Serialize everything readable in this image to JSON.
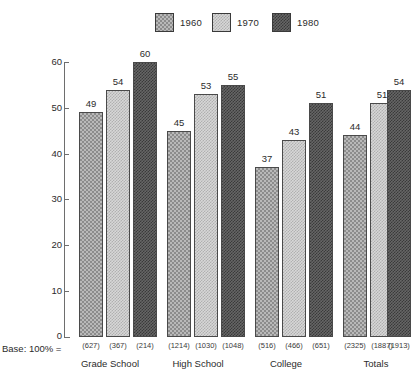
{
  "chart_data": {
    "type": "bar",
    "title": "",
    "xlabel": "",
    "ylabel": "",
    "ylim": [
      0,
      60
    ],
    "yticks": [
      0,
      10,
      20,
      30,
      40,
      50,
      60
    ],
    "grid": false,
    "legend_position": "top-center",
    "categories": [
      "Grade School",
      "High School",
      "College",
      "Totals"
    ],
    "series": [
      {
        "name": "1960",
        "values": [
          49,
          45,
          37,
          44
        ],
        "bases": [
          "(627)",
          "(1214)",
          "(516)",
          "(2325)"
        ],
        "pattern": "cross-hatch-medium",
        "color": "#b9b9b9"
      },
      {
        "name": "1970",
        "values": [
          54,
          53,
          43,
          51
        ],
        "bases": [
          "(367)",
          "(1030)",
          "(466)",
          "(1887)"
        ],
        "pattern": "fine-dot-light",
        "color": "#d7d7d7"
      },
      {
        "name": "1980",
        "values": [
          60,
          55,
          51,
          54
        ],
        "bases": [
          "(214)",
          "(1048)",
          "(651)",
          "(1913)"
        ],
        "pattern": "dense-dark",
        "color": "#666666"
      }
    ],
    "base_label": "Base: 100% =",
    "axis_color": "#6e6e6e",
    "text_color": "#2b2b2b"
  },
  "legend": {
    "items": [
      {
        "label": "1960"
      },
      {
        "label": "1970"
      },
      {
        "label": "1980"
      }
    ]
  },
  "axis": {
    "tick_labels": [
      "60",
      "50",
      "40",
      "30",
      "20",
      "10",
      "0"
    ]
  }
}
